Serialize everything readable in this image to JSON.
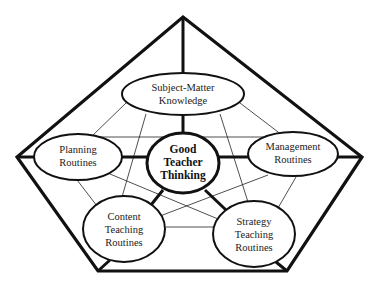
{
  "diagram": {
    "center": {
      "id": "center",
      "lines": [
        "Good",
        "Teacher",
        "Thinking"
      ]
    },
    "nodes": [
      {
        "id": "subject",
        "lines": [
          "Subject-Matter",
          "Knowledge"
        ]
      },
      {
        "id": "planning",
        "lines": [
          "Planning",
          "Routines"
        ]
      },
      {
        "id": "management",
        "lines": [
          "Management",
          "Routines"
        ]
      },
      {
        "id": "content",
        "lines": [
          "Content",
          "Teaching",
          "Routines"
        ]
      },
      {
        "id": "strategy",
        "lines": [
          "Strategy",
          "Teaching",
          "Routines"
        ]
      }
    ],
    "colors": {
      "stroke": "#111111",
      "background": "#ffffff",
      "text": "#222222"
    }
  }
}
